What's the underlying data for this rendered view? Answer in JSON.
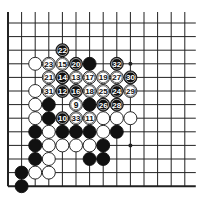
{
  "diagram": {
    "type": "go-board-fragment",
    "columns": 14,
    "rows": 13,
    "edges": {
      "left": true,
      "bottom": true,
      "top": false,
      "right": false
    },
    "grid": {
      "x0": 8,
      "y0": 23,
      "step": 13.6
    },
    "colors": {
      "line": "#222222",
      "black": "#111111",
      "white": "#ffffff",
      "background": "#ffffff"
    },
    "hoshi": [
      {
        "c": 9,
        "r": 3
      },
      {
        "c": 9,
        "r": 9
      }
    ],
    "stones": [
      {
        "c": 4,
        "r": 2,
        "color": "black",
        "label": "22"
      },
      {
        "c": 2,
        "r": 3,
        "color": "white",
        "label": ""
      },
      {
        "c": 3,
        "r": 3,
        "color": "white",
        "label": "23"
      },
      {
        "c": 4,
        "r": 3,
        "color": "white",
        "label": "15"
      },
      {
        "c": 5,
        "r": 3,
        "color": "black",
        "label": "20"
      },
      {
        "c": 6,
        "r": 3,
        "color": "black",
        "label": ""
      },
      {
        "c": 8,
        "r": 3,
        "color": "black",
        "label": "32"
      },
      {
        "c": 3,
        "r": 4,
        "color": "white",
        "label": "21"
      },
      {
        "c": 4,
        "r": 4,
        "color": "black",
        "label": "14"
      },
      {
        "c": 5,
        "r": 4,
        "color": "white",
        "label": "13"
      },
      {
        "c": 6,
        "r": 4,
        "color": "white",
        "label": "17"
      },
      {
        "c": 7,
        "r": 4,
        "color": "white",
        "label": "19"
      },
      {
        "c": 8,
        "r": 4,
        "color": "white",
        "label": "27"
      },
      {
        "c": 9,
        "r": 4,
        "color": "black",
        "label": "30"
      },
      {
        "c": 2,
        "r": 5,
        "color": "white",
        "label": ""
      },
      {
        "c": 3,
        "r": 5,
        "color": "white",
        "label": "31"
      },
      {
        "c": 4,
        "r": 5,
        "color": "black",
        "label": "12"
      },
      {
        "c": 5,
        "r": 5,
        "color": "black",
        "label": "16"
      },
      {
        "c": 6,
        "r": 5,
        "color": "white",
        "label": "18"
      },
      {
        "c": 7,
        "r": 5,
        "color": "white",
        "label": "25"
      },
      {
        "c": 8,
        "r": 5,
        "color": "black",
        "label": "24"
      },
      {
        "c": 9,
        "r": 5,
        "color": "white",
        "label": "29"
      },
      {
        "c": 2,
        "r": 6,
        "color": "white",
        "label": ""
      },
      {
        "c": 3,
        "r": 6,
        "color": "black",
        "label": ""
      },
      {
        "c": 5,
        "r": 6,
        "color": "white",
        "label": "9"
      },
      {
        "c": 6,
        "r": 6,
        "color": "black",
        "label": ""
      },
      {
        "c": 7,
        "r": 6,
        "color": "black",
        "label": "26"
      },
      {
        "c": 8,
        "r": 6,
        "color": "black",
        "label": "28"
      },
      {
        "c": 2,
        "r": 7,
        "color": "white",
        "label": ""
      },
      {
        "c": 3,
        "r": 7,
        "color": "black",
        "label": ""
      },
      {
        "c": 4,
        "r": 7,
        "color": "black",
        "label": "10"
      },
      {
        "c": 5,
        "r": 7,
        "color": "white",
        "label": "33"
      },
      {
        "c": 6,
        "r": 7,
        "color": "white",
        "label": "11"
      },
      {
        "c": 7,
        "r": 7,
        "color": "white",
        "label": ""
      },
      {
        "c": 8,
        "r": 7,
        "color": "white",
        "label": ""
      },
      {
        "c": 9,
        "r": 7,
        "color": "white",
        "label": ""
      },
      {
        "c": 2,
        "r": 8,
        "color": "black",
        "label": ""
      },
      {
        "c": 3,
        "r": 8,
        "color": "white",
        "label": ""
      },
      {
        "c": 4,
        "r": 8,
        "color": "black",
        "label": ""
      },
      {
        "c": 5,
        "r": 8,
        "color": "black",
        "label": ""
      },
      {
        "c": 6,
        "r": 8,
        "color": "black",
        "label": ""
      },
      {
        "c": 7,
        "r": 8,
        "color": "white",
        "label": ""
      },
      {
        "c": 8,
        "r": 8,
        "color": "black",
        "label": ""
      },
      {
        "c": 2,
        "r": 9,
        "color": "black",
        "label": ""
      },
      {
        "c": 3,
        "r": 9,
        "color": "white",
        "label": ""
      },
      {
        "c": 4,
        "r": 9,
        "color": "white",
        "label": ""
      },
      {
        "c": 5,
        "r": 9,
        "color": "white",
        "label": ""
      },
      {
        "c": 6,
        "r": 9,
        "color": "white",
        "label": ""
      },
      {
        "c": 7,
        "r": 9,
        "color": "black",
        "label": ""
      },
      {
        "c": 2,
        "r": 10,
        "color": "black",
        "label": ""
      },
      {
        "c": 3,
        "r": 10,
        "color": "white",
        "label": ""
      },
      {
        "c": 6,
        "r": 10,
        "color": "black",
        "label": ""
      },
      {
        "c": 7,
        "r": 10,
        "color": "black",
        "label": ""
      },
      {
        "c": 1,
        "r": 11,
        "color": "black",
        "label": ""
      },
      {
        "c": 2,
        "r": 11,
        "color": "white",
        "label": ""
      },
      {
        "c": 3,
        "r": 11,
        "color": "white",
        "label": ""
      },
      {
        "c": 1,
        "r": 12,
        "color": "black",
        "label": ""
      }
    ]
  }
}
